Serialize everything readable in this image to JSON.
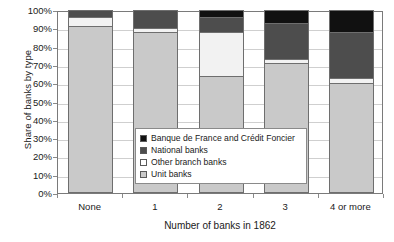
{
  "chart_data": {
    "type": "bar",
    "subtype": "stacked-bar-100-percent",
    "title": "",
    "xlabel": "Number of banks in 1862",
    "ylabel": "Share of banks by type",
    "categories": [
      "None",
      "1",
      "2",
      "3",
      "4 or more"
    ],
    "ylim": [
      0,
      100
    ],
    "ytick_labels": [
      "0%",
      "10%",
      "20%",
      "30%",
      "40%",
      "50%",
      "60%",
      "70%",
      "80%",
      "90%",
      "100%"
    ],
    "ytick_values": [
      0,
      10,
      20,
      30,
      40,
      50,
      60,
      70,
      80,
      90,
      100
    ],
    "grid": true,
    "legend_position": "inside-center",
    "stack_order_bottom_to_top": [
      "Unit banks",
      "Other branch banks",
      "National banks",
      "Banque de France and Crédit Foncier"
    ],
    "series": [
      {
        "name": "Unit banks",
        "color": "#c9c9c9",
        "values": [
          91,
          88,
          64,
          71,
          60
        ]
      },
      {
        "name": "Other branch banks",
        "color": "#f2f2f2",
        "values": [
          5,
          2,
          24,
          2,
          3
        ]
      },
      {
        "name": "National banks",
        "color": "#4d4d4d",
        "values": [
          4,
          10,
          8,
          20,
          25
        ]
      },
      {
        "name": "Banque de France and Crédit Foncier",
        "color": "#111111",
        "values": [
          0,
          0,
          4,
          7,
          12
        ]
      }
    ]
  },
  "legend": {
    "items": [
      {
        "label": "Banque de France and Crédit Foncier",
        "color": "#111111"
      },
      {
        "label": "National banks",
        "color": "#4d4d4d"
      },
      {
        "label": "Other branch banks",
        "color": "#ffffff"
      },
      {
        "label": "Unit banks",
        "color": "#c9c9c9"
      }
    ]
  },
  "axes": {
    "y_title": "Share of banks by type",
    "x_title": "Number of banks in 1862"
  },
  "colors": {
    "plot_border": "#7a7a7a",
    "gridline": "#cfcfcf",
    "bar_outline": "#6e6e6e",
    "background": "#ffffff",
    "text": "#1a1a1a"
  }
}
